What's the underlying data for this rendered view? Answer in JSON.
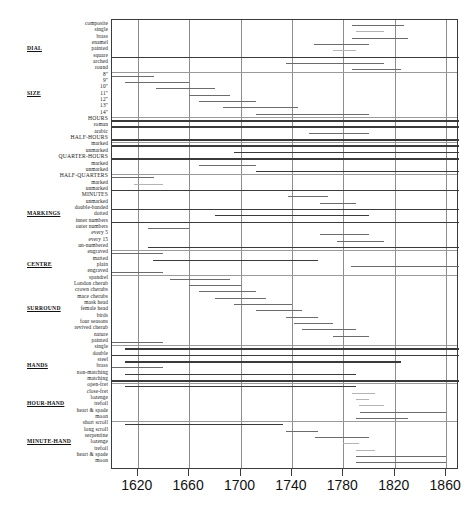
{
  "chart_data": {
    "type": "bar",
    "title": "",
    "subtitle": "",
    "xlabel": "",
    "ylabel": "",
    "orientation": "horizontal-timeline",
    "grid": true,
    "legend": "none",
    "xlim": [
      1600,
      1870
    ],
    "xticks": [
      1620,
      1660,
      1700,
      1740,
      1780,
      1820,
      1860
    ],
    "xtick_labels": [
      "1620",
      "1660",
      "1700",
      "1740",
      "1780",
      "1820",
      "1860"
    ],
    "note": "Each row is a clock-dial feature; the horizontal bar marks the span of years the feature was in use.",
    "groups": [
      {
        "name": "DIAL",
        "rows": [
          {
            "label": "composite",
            "start": 1787,
            "end": 1827
          },
          {
            "label": "single",
            "start": 1790,
            "end": 1812
          },
          {
            "label": "brass",
            "start": 1787,
            "end": 1830
          },
          {
            "label": "enamel",
            "start": 1757,
            "end": 1800
          },
          {
            "label": "painted",
            "start": 1772,
            "end": 1790
          },
          {
            "label": "square",
            "start": 1600,
            "end": 1870
          },
          {
            "label": "arched",
            "start": 1735,
            "end": 1812
          },
          {
            "label": "round",
            "start": 1787,
            "end": 1825
          }
        ]
      },
      {
        "name": "SIZE",
        "rows": [
          {
            "label": "8\"",
            "start": 1600,
            "end": 1633
          },
          {
            "label": "9\"",
            "start": 1610,
            "end": 1660
          },
          {
            "label": "10\"",
            "start": 1634,
            "end": 1680
          },
          {
            "label": "11\"",
            "start": 1660,
            "end": 1692
          },
          {
            "label": "12\"",
            "start": 1668,
            "end": 1712
          },
          {
            "label": "13\"",
            "start": 1686,
            "end": 1745
          },
          {
            "label": "14\"",
            "start": 1712,
            "end": 1800
          }
        ]
      },
      {
        "name": "",
        "rows": [
          {
            "label": "HOURS",
            "start": 1600,
            "end": 1870
          },
          {
            "label": "roman",
            "start": 1600,
            "end": 1870
          },
          {
            "label": "arabic",
            "start": 1753,
            "end": 1800
          },
          {
            "label": "HALF-HOURS",
            "start": 1600,
            "end": 1870
          }
        ]
      },
      {
        "name": "",
        "rows": [
          {
            "label": "marked",
            "start": 1600,
            "end": 1870
          },
          {
            "label": "unmarked",
            "start": 1695,
            "end": 1870
          },
          {
            "label": "QUARTER-HOURS",
            "start": 1600,
            "end": 1870
          },
          {
            "label": "marked",
            "start": 1668,
            "end": 1712
          },
          {
            "label": "unmarked",
            "start": 1712,
            "end": 1870
          }
        ]
      },
      {
        "name": "MARKINGS",
        "rows": [
          {
            "label": "HALF-QUARTERS",
            "start": 1600,
            "end": 1633
          },
          {
            "label": "marked",
            "start": 1617,
            "end": 1640
          },
          {
            "label": "unmarked",
            "start": 1600,
            "end": 1870
          },
          {
            "label": "MINUTES",
            "start": 1737,
            "end": 1768
          },
          {
            "label": "unmarked",
            "start": 1762,
            "end": 1790
          },
          {
            "label": "double-banded",
            "start": 1600,
            "end": 1870
          },
          {
            "label": "dotted",
            "start": 1680,
            "end": 1800
          },
          {
            "label": "inner numbers",
            "start": 1600,
            "end": 1870
          },
          {
            "label": "outer numbers",
            "start": 1628,
            "end": 1660
          },
          {
            "label": "every 5",
            "start": 1762,
            "end": 1800
          },
          {
            "label": "every 15",
            "start": 1775,
            "end": 1812
          },
          {
            "label": "un-numbered",
            "start": 1628,
            "end": 1870
          }
        ]
      },
      {
        "name": "CENTRE",
        "rows": [
          {
            "label": "engraved",
            "start": 1600,
            "end": 1640
          },
          {
            "label": "matted",
            "start": 1632,
            "end": 1760
          },
          {
            "label": "plain",
            "start": 1786,
            "end": 1870
          },
          {
            "label": "engraved",
            "start": 1600,
            "end": 1640
          }
        ]
      },
      {
        "name": "SURROUND",
        "rows": [
          {
            "label": "spandrel",
            "start": 1645,
            "end": 1692
          },
          {
            "label": "London cherub",
            "start": 1660,
            "end": 1700
          },
          {
            "label": "crown cherubs",
            "start": 1668,
            "end": 1712
          },
          {
            "label": "mace cherubs",
            "start": 1680,
            "end": 1720
          },
          {
            "label": "mask head",
            "start": 1695,
            "end": 1740
          },
          {
            "label": "female head",
            "start": 1712,
            "end": 1748
          },
          {
            "label": "birds",
            "start": 1735,
            "end": 1760
          },
          {
            "label": "four seasons",
            "start": 1742,
            "end": 1772
          },
          {
            "label": "revived cherub",
            "start": 1748,
            "end": 1790
          },
          {
            "label": "nature",
            "start": 1772,
            "end": 1800
          },
          {
            "label": "painted",
            "start": 1600,
            "end": 1640
          }
        ]
      },
      {
        "name": "HANDS",
        "rows": [
          {
            "label": "single",
            "start": 1610,
            "end": 1870
          },
          {
            "label": "double",
            "start": 1600,
            "end": 1870
          },
          {
            "label": "steel",
            "start": 1610,
            "end": 1825
          },
          {
            "label": "brass",
            "start": 1600,
            "end": 1640
          },
          {
            "label": "non-matching",
            "start": 1610,
            "end": 1790
          },
          {
            "label": "matching",
            "start": 1600,
            "end": 1870
          }
        ]
      },
      {
        "name": "HOUR-HAND",
        "rows": [
          {
            "label": "open-fret",
            "start": 1610,
            "end": 1790
          },
          {
            "label": "close-fret",
            "start": 1787,
            "end": 1805
          },
          {
            "label": "lozenge",
            "start": 1790,
            "end": 1800
          },
          {
            "label": "trefoil",
            "start": 1792,
            "end": 1812
          },
          {
            "label": "heart & spade",
            "start": 1793,
            "end": 1860
          },
          {
            "label": "moon",
            "start": 1790,
            "end": 1830
          }
        ]
      },
      {
        "name": "MINUTE-HAND",
        "rows": [
          {
            "label": "short scroll",
            "start": 1610,
            "end": 1733
          },
          {
            "label": "long scroll",
            "start": 1735,
            "end": 1760
          },
          {
            "label": "serpentine",
            "start": 1758,
            "end": 1800
          },
          {
            "label": "lozenge",
            "start": 1780,
            "end": 1792
          },
          {
            "label": "trefoil",
            "start": 1790,
            "end": 1805
          },
          {
            "label": "heart & spade",
            "start": 1790,
            "end": 1860
          },
          {
            "label": "moon",
            "start": 1790,
            "end": 1860
          }
        ]
      }
    ]
  }
}
